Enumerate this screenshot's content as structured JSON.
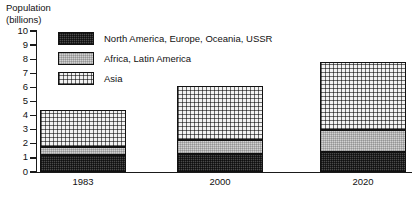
{
  "chart_data": {
    "type": "bar",
    "subtype": "stacked",
    "title": "Population (billions)",
    "ylabel": "Population (billions)",
    "xlabel": "",
    "categories": [
      "1983",
      "2000",
      "2020"
    ],
    "ylim": [
      0,
      10
    ],
    "yticks": [
      0,
      1,
      2,
      3,
      4,
      5,
      6,
      7,
      8,
      9,
      10
    ],
    "ytick_labels": [
      "0",
      "1",
      "2",
      "3",
      "4",
      "5",
      "6",
      "7",
      "8",
      "9",
      "10"
    ],
    "grid": false,
    "legend_position": "upper-left-inside",
    "stack_order_bottom_to_top": [
      "North America, Europe, Oceania, USSR",
      "Africa, Latin America",
      "Asia"
    ],
    "series": [
      {
        "name": "North America, Europe, Oceania, USSR",
        "fill": "dark-crosshatch",
        "color": "#4a4a4a",
        "values": [
          1.2,
          1.3,
          1.4
        ]
      },
      {
        "name": "Africa, Latin America",
        "fill": "light-gray",
        "color": "#d2d2d2",
        "values": [
          0.6,
          1.0,
          1.6
        ]
      },
      {
        "name": "Asia",
        "fill": "fine-dotted",
        "color": "#f2f2f2",
        "values": [
          2.6,
          3.8,
          4.8
        ]
      }
    ],
    "totals": [
      4.4,
      6.1,
      7.8
    ]
  },
  "axis": {
    "title_line1": "Population",
    "title_line2": "(billions)"
  },
  "legend": {
    "items": [
      {
        "label": "North America, Europe, Oceania, USSR",
        "swatch": "dark"
      },
      {
        "label": "Africa, Latin America",
        "swatch": "gray"
      },
      {
        "label": "Asia",
        "swatch": "dot"
      }
    ]
  }
}
